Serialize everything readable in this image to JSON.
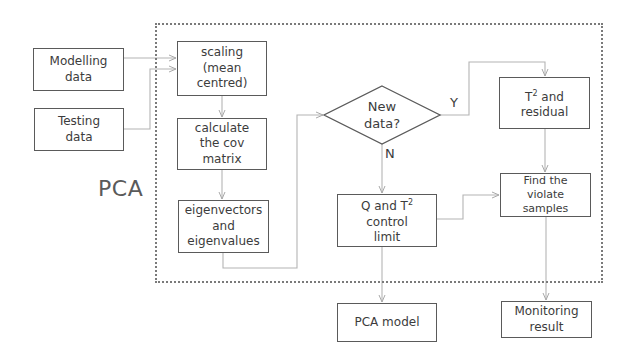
{
  "diagram": {
    "title": "PCA",
    "inputs": [
      {
        "id": "modelling",
        "label": "Modelling\ndata"
      },
      {
        "id": "testing",
        "label": "Testing\ndata"
      }
    ],
    "steps": {
      "scaling": "scaling\n(mean\ncentred)",
      "cov": "calculate\nthe cov\nmatrix",
      "eigen": "eigenvectors\nand\neigenvalues",
      "decision": "New\ndata?",
      "decision_yes": "Y",
      "decision_no": "N",
      "t2_residual_prefix": "T",
      "t2_residual_sup": "2",
      "t2_residual_suffix": " and\nresidual",
      "control_limit_prefix": "Q and T",
      "control_limit_sup": "2",
      "control_limit_suffix": "\ncontrol\nlimit",
      "violate": "Find the\nviolate\nsamples"
    },
    "outputs": {
      "pca_model": "PCA model",
      "monitoring": "Monitoring\nresult"
    },
    "colors": {
      "box_border": "#5a5a5a",
      "arrow": "#b0b0b0",
      "container_border": "#7a7a7a",
      "text": "#3c3c3c"
    }
  }
}
